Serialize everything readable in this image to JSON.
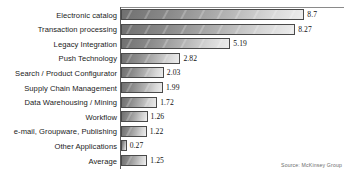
{
  "chart_data": {
    "type": "bar",
    "orientation": "horizontal",
    "title": "",
    "xlabel": "",
    "ylabel": "",
    "xlim": [
      0,
      9.4
    ],
    "grid": false,
    "legend": null,
    "source_note": "Source: McKinsey Group",
    "categories": [
      "Electronic catalog",
      "Transaction processing",
      "Legacy Integration",
      "Push Technology",
      "Search / Product Configurator",
      "Supply Chain Management",
      "Data Warehousing / Mining",
      "Workflow",
      "e-mail, Groupware, Publishing",
      "Other Applications",
      "Average"
    ],
    "values": [
      8.7,
      8.27,
      5.19,
      2.82,
      2.03,
      1.99,
      1.72,
      1.26,
      1.22,
      0.27,
      1.25
    ],
    "value_labels": [
      "8.7",
      "8.27",
      "5.19",
      "2.82",
      "2.03",
      "1.99",
      "1.72",
      "1.26",
      "1.22",
      "0.27",
      "1.25"
    ]
  },
  "style": {
    "bar_fill_dark": "#707070",
    "bar_fill_light": "#ececec",
    "bar_border": "#4a4a4a",
    "axis_color": "#5a5a5a",
    "text_color": "#1a1a1a",
    "source_color": "#6d6d6d",
    "background": "#ffffff"
  }
}
